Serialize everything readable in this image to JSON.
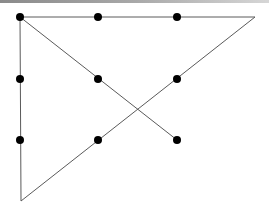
{
  "diagram": {
    "title": "",
    "line_color": "#5a5a5a",
    "dot_color": "#000000",
    "dot_radius": 4,
    "dots": [
      {
        "row": 1,
        "col": 1,
        "x": 20,
        "y": 17
      },
      {
        "row": 1,
        "col": 2,
        "x": 98,
        "y": 17
      },
      {
        "row": 1,
        "col": 3,
        "x": 177,
        "y": 17
      },
      {
        "row": 2,
        "col": 1,
        "x": 20,
        "y": 79
      },
      {
        "row": 2,
        "col": 2,
        "x": 98,
        "y": 79
      },
      {
        "row": 2,
        "col": 3,
        "x": 177,
        "y": 79
      },
      {
        "row": 3,
        "col": 1,
        "x": 20,
        "y": 140
      },
      {
        "row": 3,
        "col": 2,
        "x": 98,
        "y": 140
      },
      {
        "row": 3,
        "col": 3,
        "x": 177,
        "y": 140
      }
    ],
    "path_vertices": [
      {
        "x": 177,
        "y": 140
      },
      {
        "x": 20,
        "y": 17
      },
      {
        "x": 255,
        "y": 17
      },
      {
        "x": 21,
        "y": 201
      },
      {
        "x": 20,
        "y": 17
      }
    ]
  }
}
